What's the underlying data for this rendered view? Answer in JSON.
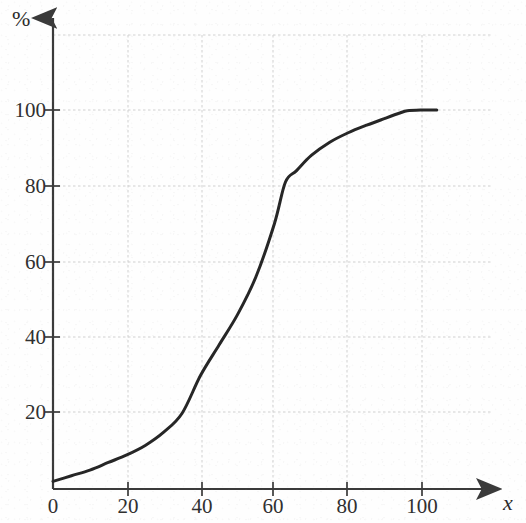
{
  "chart_data": {
    "type": "line",
    "title": "",
    "xlabel": "x",
    "ylabel": "%",
    "xlim": [
      0,
      110
    ],
    "ylim": [
      0,
      120
    ],
    "grid": true,
    "legend": "none",
    "x_ticks": [
      0,
      20,
      40,
      60,
      80,
      100
    ],
    "x_tick_labels": [
      "0",
      "20",
      "40",
      "60",
      "80",
      "100"
    ],
    "y_ticks": [
      20,
      40,
      60,
      80,
      100
    ],
    "y_tick_labels": [
      "20",
      "40",
      "60",
      "80",
      "100"
    ],
    "series": [
      {
        "name": "cumulative percentage",
        "x": [
          0,
          5,
          10,
          15,
          20,
          25,
          30,
          35,
          40,
          45,
          50,
          55,
          60,
          63,
          66,
          70,
          75,
          80,
          85,
          90,
          94,
          96,
          100,
          104
        ],
        "y": [
          2,
          3.5,
          5,
          7,
          9,
          11.5,
          15,
          20,
          30,
          38,
          46,
          56,
          70,
          81,
          84,
          88,
          91.5,
          94,
          96,
          97.8,
          99.2,
          99.8,
          100,
          100
        ]
      }
    ],
    "notes": {
      "shape": "S-shaped ogive / cumulative distribution curve",
      "kink_point": {
        "x": 63,
        "y": 81
      },
      "plateau_value": 100,
      "plateau_starts_at_x": 96,
      "curve_end_x": 104,
      "curve_start": {
        "x": 0,
        "y": 2
      }
    }
  },
  "style": {
    "curve_color": "#262626",
    "grid_color": "#cfcfcf",
    "axis_color": "#3a3a3a",
    "background": "#fefefe",
    "tick_text_color": "#303030"
  },
  "axes": {
    "y_axis_name": "percent-axis",
    "x_axis_name": "x-axis",
    "y_axis_label": "%",
    "x_axis_label": "x"
  }
}
